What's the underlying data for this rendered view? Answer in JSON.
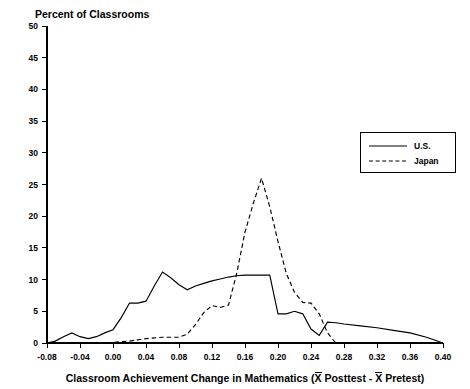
{
  "chart_data": {
    "type": "line",
    "title": "Percent of Classrooms",
    "xlabel": "Classroom Achievement Change in Mathematics (X Posttest - X Pretest)",
    "ylabel": "Percent of Classrooms",
    "xlim": [
      -0.08,
      0.4
    ],
    "ylim": [
      0,
      50
    ],
    "grid": false,
    "legend_position": "upper-right",
    "x_ticks": [
      -0.08,
      -0.04,
      0.0,
      0.04,
      0.08,
      0.12,
      0.16,
      0.2,
      0.24,
      0.28,
      0.32,
      0.36,
      0.4
    ],
    "x_tick_labels": [
      "-0.08",
      "-0.04",
      "0.00",
      "0.04",
      "0.08",
      "0.12",
      "0.16",
      "0.20",
      "0.24",
      "0.28",
      "0.32",
      "0.36",
      "0.40"
    ],
    "y_ticks": [
      0,
      5,
      10,
      15,
      20,
      25,
      30,
      35,
      40,
      45,
      50
    ],
    "y_tick_labels": [
      "0",
      "5",
      "10",
      "15",
      "20",
      "25",
      "30",
      "35",
      "40",
      "45",
      "50"
    ],
    "x": [
      -0.08,
      -0.07,
      -0.06,
      -0.05,
      -0.04,
      -0.03,
      -0.02,
      -0.01,
      0.0,
      0.01,
      0.02,
      0.03,
      0.04,
      0.05,
      0.06,
      0.07,
      0.08,
      0.09,
      0.1,
      0.11,
      0.12,
      0.13,
      0.14,
      0.15,
      0.16,
      0.17,
      0.18,
      0.19,
      0.2,
      0.21,
      0.22,
      0.23,
      0.24,
      0.25,
      0.26,
      0.27,
      0.28,
      0.3,
      0.32,
      0.34,
      0.36,
      0.38,
      0.4
    ],
    "series": [
      {
        "name": "U.S.",
        "style": "solid",
        "values": [
          0.0,
          0.3,
          1.0,
          1.6,
          1.0,
          0.7,
          1.0,
          1.6,
          2.1,
          4.0,
          6.3,
          6.3,
          6.6,
          9.0,
          11.2,
          10.3,
          9.2,
          8.4,
          9.0,
          9.4,
          9.8,
          10.1,
          10.4,
          10.6,
          10.7,
          10.7,
          10.7,
          10.7,
          4.6,
          4.6,
          5.0,
          4.6,
          2.2,
          1.2,
          3.3,
          3.2,
          3.0,
          2.7,
          2.4,
          2.0,
          1.6,
          0.9,
          0.0
        ]
      },
      {
        "name": "Japan",
        "style": "dashed",
        "values": [
          0.0,
          0.0,
          0.0,
          0.0,
          0.0,
          0.0,
          0.0,
          0.0,
          0.1,
          0.2,
          0.3,
          0.5,
          0.7,
          0.8,
          0.9,
          0.9,
          0.9,
          1.4,
          2.9,
          4.8,
          5.9,
          5.6,
          6.0,
          11.0,
          17.5,
          22.0,
          26.0,
          21.5,
          16.0,
          11.0,
          8.0,
          6.4,
          6.3,
          4.6,
          1.6,
          0.0,
          0.0,
          0.0,
          0.0,
          0.0,
          0.0,
          0.0,
          0.0
        ]
      }
    ],
    "legend": [
      {
        "label": "U.S.",
        "style": "solid"
      },
      {
        "label": "Japan",
        "style": "dashed"
      }
    ],
    "axis_title_parts": {
      "before_x1": "Classroom Achievement Change in Mathematics (",
      "x1": "X",
      "mid": " Posttest - ",
      "x2": "X",
      "after": " Pretest)"
    }
  }
}
